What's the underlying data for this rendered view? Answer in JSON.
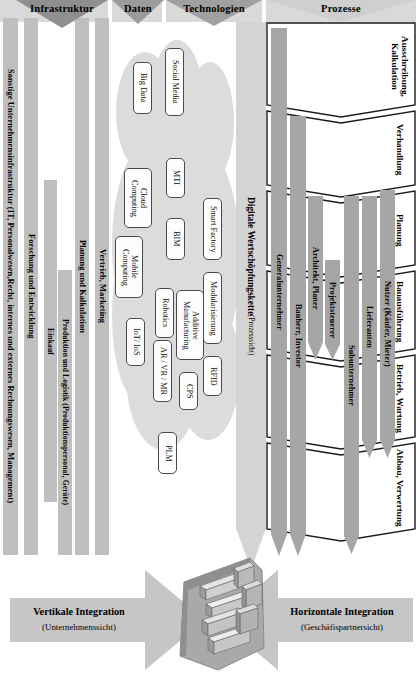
{
  "figure": {
    "title_headers": [
      {
        "label": "Infrastruktur"
      },
      {
        "label": "Daten"
      },
      {
        "label": "Technologien"
      },
      {
        "label": "Prozesse"
      }
    ]
  },
  "infrastructure": {
    "bars": [
      {
        "label": "Sonstige Unternehmensinfrastruktur (IT, Personalwesen,Recht, internes und externes Rechnungswesen, Management)"
      },
      {
        "label": "Forschung und Entwicklung"
      },
      {
        "label": "Einkauf"
      }
    ]
  },
  "value_chain": {
    "bars": [
      {
        "label": "Planung und Kalkulation"
      },
      {
        "label": "Vertrieb, Marketing"
      },
      {
        "label": "Produktion und Logistik (Produktionspersonal, Geräte)"
      }
    ]
  },
  "technologies": {
    "chips": [
      {
        "label": "Big Data"
      },
      {
        "label": "Social Media"
      },
      {
        "label": "Cloud Computing"
      },
      {
        "label": "MTI"
      },
      {
        "label": "Smart Factory"
      },
      {
        "label": "Mobile Computing"
      },
      {
        "label": "BIM"
      },
      {
        "label": "Modularisierung"
      },
      {
        "label": "Robotics"
      },
      {
        "label": "Additive Manufacturing"
      },
      {
        "label": "IoT/ IoS"
      },
      {
        "label": "AR / VR / MR"
      },
      {
        "label": "CPS"
      },
      {
        "label": "RFID"
      },
      {
        "label": "PLM"
      }
    ]
  },
  "digital_value_chain": {
    "title": "Digitale Wertschöpfungskette",
    "subtitle": "(Prozesssicht)"
  },
  "processes": {
    "stages": [
      {
        "label": "Ausschreibung, Kalkulation"
      },
      {
        "label": "Verhandlung"
      },
      {
        "label": "Planung"
      },
      {
        "label": "Bauausführung"
      },
      {
        "label": "Betrieb, Wartung"
      },
      {
        "label": "Abbau, Verwertung"
      }
    ]
  },
  "stakeholders": [
    {
      "label": "Generalunternehmer"
    },
    {
      "label": "Bauherr, Investor"
    },
    {
      "label": "Architekt, Planer"
    },
    {
      "label": "Projektsteuerer"
    },
    {
      "label": "Subunternehmer"
    },
    {
      "label": "Lieferanten"
    },
    {
      "label": "Nutzer (Käufer, Mieter)"
    }
  ],
  "integration": {
    "vertical": {
      "title": "Vertikale Integration",
      "subtitle": "(Unternehmenssicht)"
    },
    "horizontal": {
      "title": "Horizontale Integration",
      "subtitle": "(Geschäfispartnersicht)"
    }
  },
  "icons": {
    "city": "isometric-city-icon",
    "vertical_arrow": "right-arrow-icon",
    "horizontal_arrow": "left-arrow-icon",
    "header_marker": "down-triangle-icon"
  },
  "colors": {
    "bar_fill": "#bfbfbf",
    "cloud_fill": "#dcdcdc",
    "band_fill": "#d4d4d4",
    "header_fill": "#d9d9d9",
    "arrow_fill": "#c6c6c6",
    "stroke": "#1a1a1a"
  }
}
